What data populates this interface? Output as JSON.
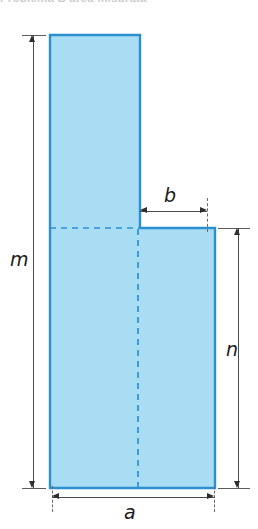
{
  "figure": {
    "caption_clipped": "Problema B area misurata"
  },
  "colors": {
    "fill": "#a9ddf3",
    "stroke": "#2b8fd0",
    "construction": "#2f8fd4",
    "dimension": "#2e2e2e",
    "background": "#ffffff"
  },
  "shape": {
    "name": "step-polygon",
    "outline_points": "50,35 140,35 140,228 215,228 215,488 50,488",
    "construction_lines": {
      "horizontal_dashed": {
        "x1": 50,
        "y1": 228,
        "x2": 140,
        "y2": 228
      },
      "vertical_dashed": {
        "x1": 138,
        "y1": 228,
        "x2": 138,
        "y2": 488
      }
    }
  },
  "dimensions": [
    {
      "id": "m",
      "label": "m",
      "orientation": "vertical",
      "side": "left",
      "line": {
        "x": 33,
        "y1": 35,
        "y2": 488
      },
      "label_pos": {
        "x": 10,
        "y": 250
      },
      "extension_ticks": [
        {
          "x1": 22,
          "y": 35,
          "x2": 46
        },
        {
          "x1": 22,
          "y": 488,
          "x2": 46
        }
      ]
    },
    {
      "id": "b",
      "label": "b",
      "orientation": "horizontal",
      "side": "top",
      "line": {
        "y": 211,
        "x1": 140,
        "x2": 207
      },
      "label_pos": {
        "x": 164,
        "y": 186
      },
      "extension_ticks": [
        {
          "x": 207,
          "y1": 198,
          "y2": 232
        }
      ]
    },
    {
      "id": "n",
      "label": "n",
      "orientation": "vertical",
      "side": "right",
      "line": {
        "x": 238,
        "y1": 228,
        "y2": 488
      },
      "label_pos": {
        "x": 226,
        "y": 340
      },
      "extension_ticks": [
        {
          "x1": 218,
          "y": 228,
          "x2": 250
        },
        {
          "x1": 218,
          "y": 488,
          "x2": 250
        }
      ]
    },
    {
      "id": "a",
      "label": "a",
      "orientation": "horizontal",
      "side": "bottom",
      "line": {
        "y": 497,
        "x1": 52,
        "x2": 214
      },
      "label_pos": {
        "x": 124,
        "y": 503
      },
      "extension_ticks": [
        {
          "x": 52,
          "y1": 486,
          "y2": 512
        },
        {
          "x": 214,
          "y1": 486,
          "y2": 512
        }
      ]
    }
  ]
}
